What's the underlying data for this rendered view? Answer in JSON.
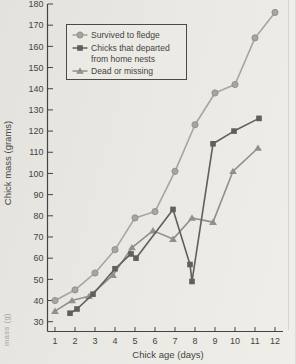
{
  "colors": {
    "axis": "#45443f",
    "tick_text": "#45443f",
    "legend_border": "#4b4a46",
    "legend_fill": "#ebeae5",
    "page_edge_line": "#d6d4ce",
    "page_edge_fill": "#efeeea",
    "survived": "#a6a5a0",
    "survived_edge": "#8f8e88",
    "departed": "#605f5b",
    "dead": "#91908a"
  },
  "y_axis": {
    "label": "Chick mass (grams)",
    "min": 30,
    "max": 180,
    "step": 10
  },
  "x_axis": {
    "label": "Chick age (days)"
  },
  "legend": {
    "items": [
      {
        "marker": "circle",
        "lines": [
          "Survived to fledge"
        ]
      },
      {
        "marker": "square",
        "lines": [
          "Chicks that departed",
          "from home nests"
        ]
      },
      {
        "marker": "triangle",
        "lines": [
          "Dead or missing"
        ]
      }
    ]
  },
  "margin_note": "mass (g)",
  "chart_data": {
    "type": "line",
    "title": "",
    "xlabel": "Chick age (days)",
    "ylabel": "Chick mass (grams)",
    "xlim": [
      0.6,
      12.6
    ],
    "ylim": [
      30,
      180
    ],
    "x_ticks": [
      1,
      2,
      3,
      4,
      5,
      6,
      7,
      8,
      9,
      10,
      11,
      12
    ],
    "y_ticks": [
      30,
      40,
      50,
      60,
      70,
      80,
      90,
      100,
      110,
      120,
      130,
      140,
      150,
      160,
      170,
      180
    ],
    "grid": false,
    "legend_position": "upper-left",
    "series": [
      {
        "name": "Survived to fledge",
        "marker": "circle",
        "x": [
          1,
          2,
          3,
          4,
          5,
          6,
          7,
          8,
          9,
          10,
          11,
          12
        ],
        "y": [
          40,
          45,
          53,
          64,
          79,
          82,
          101,
          123,
          138,
          142,
          164,
          176
        ]
      },
      {
        "name": "Chicks that departed from home nests",
        "marker": "square",
        "x": [
          1.75,
          2.1,
          2.9,
          4.0,
          4.8,
          5.05,
          6.9,
          7.75,
          7.85,
          8.9,
          9.95,
          11.2
        ],
        "y": [
          34,
          36,
          43,
          55,
          62,
          60,
          83,
          57,
          49,
          114,
          120,
          126
        ]
      },
      {
        "name": "Dead or missing",
        "marker": "triangle",
        "x": [
          1.0,
          1.85,
          2.7,
          3.9,
          4.85,
          5.9,
          6.9,
          7.85,
          8.9,
          9.9,
          11.15
        ],
        "y": [
          35,
          40,
          42,
          52,
          65,
          73,
          69,
          79,
          77,
          101,
          112
        ]
      }
    ]
  }
}
